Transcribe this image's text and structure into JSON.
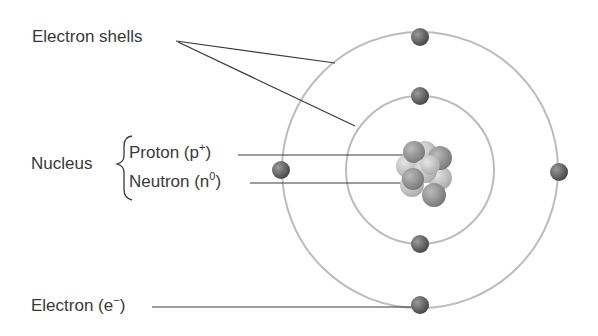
{
  "diagram": {
    "labels": {
      "electron_shells": "Electron shells",
      "nucleus": "Nucleus",
      "proton": "Proton (p",
      "proton_sup": "+",
      "proton_close": ")",
      "neutron": "Neutron (n",
      "neutron_sup": "0",
      "neutron_close": ")",
      "electron": "Electron (e",
      "electron_sup": "−",
      "electron_close": ")"
    },
    "colors": {
      "shell": "#b8b8b8",
      "leader": "#333333",
      "electron": "#6a6a6a"
    }
  }
}
